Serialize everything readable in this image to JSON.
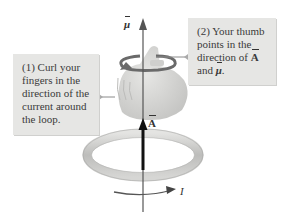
{
  "callouts": {
    "step1": "(1) Curl your fingers in the direction of the current around the loop.",
    "step2_prefix": "(2) Your thumb points in the direction of ",
    "step2_A": "A",
    "step2_and": " and ",
    "step2_mu": "μ",
    "step2_end": "."
  },
  "labels": {
    "mu": "μ",
    "A": "A",
    "I": "I"
  },
  "colors": {
    "callout_bg": "#e6e6e4",
    "axis": "#555555",
    "ring": "#c9c9c7",
    "hand": "#d8d8d6"
  }
}
